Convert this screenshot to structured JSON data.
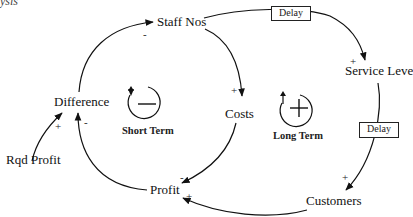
{
  "diagram": {
    "type": "causal-loop-diagram",
    "corner_fragment": "ysis",
    "nodes": [
      {
        "id": "staff_nos",
        "label": "Staff Nos"
      },
      {
        "id": "service_level",
        "label": "Service Leve"
      },
      {
        "id": "costs",
        "label": "Costs"
      },
      {
        "id": "difference",
        "label": "Difference"
      },
      {
        "id": "rqd_profit",
        "label": "Rqd Profit"
      },
      {
        "id": "profit",
        "label": "Profit"
      },
      {
        "id": "customers",
        "label": "Customers"
      }
    ],
    "links": [
      {
        "from": "difference",
        "to": "staff_nos",
        "polarity": "-"
      },
      {
        "from": "staff_nos",
        "to": "costs",
        "polarity": "+"
      },
      {
        "from": "staff_nos",
        "to": "service_level",
        "polarity": "+",
        "delay": true
      },
      {
        "from": "service_level",
        "to": "customers",
        "polarity": "+",
        "delay": true
      },
      {
        "from": "costs",
        "to": "profit",
        "polarity": "-"
      },
      {
        "from": "customers",
        "to": "profit",
        "polarity": "+"
      },
      {
        "from": "profit",
        "to": "difference",
        "polarity": "-"
      },
      {
        "from": "rqd_profit",
        "to": "difference",
        "polarity": "+"
      }
    ],
    "delay_label": "Delay",
    "loops": [
      {
        "name": "Short Term",
        "type": "balancing",
        "symbol": "−"
      },
      {
        "name": "Long Term",
        "type": "reinforcing",
        "symbol": "+"
      }
    ],
    "polarity": {
      "diff_staff": "-",
      "staff_costs": "+",
      "staff_service": "+",
      "service_customers": "+",
      "costs_profit": "-",
      "customers_profit": "+",
      "profit_diff": "-",
      "rqd_diff": "+"
    }
  }
}
